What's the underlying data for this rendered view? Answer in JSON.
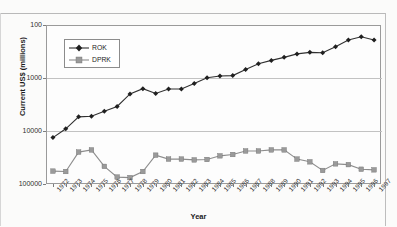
{
  "page": {
    "header_ghost_text": "",
    "background": "#fbfbfa"
  },
  "axis": {
    "y_title": "Current US$ (millions)",
    "x_title": "Year",
    "y_ticks": [
      "100000",
      "10000",
      "1000",
      "100"
    ]
  },
  "legend": {
    "items": [
      {
        "label": "ROK",
        "color": "#202020",
        "marker": "diamond"
      },
      {
        "label": "DPRK",
        "color": "#9a9a9a",
        "marker": "square"
      }
    ]
  },
  "chart_data": {
    "type": "line",
    "title": "",
    "xlabel": "Year",
    "ylabel": "Current US$ (millions)",
    "yscale": "log",
    "ylim": [
      100,
      100000
    ],
    "ytick_values": [
      100,
      1000,
      10000,
      100000
    ],
    "grid": "horizontal",
    "legend_position": "upper-left-inside",
    "categories": [
      "1972",
      "1973",
      "1974",
      "1975",
      "1976",
      "1977",
      "1978",
      "1979",
      "1980",
      "1981",
      "1982",
      "1983",
      "1984",
      "1985",
      "1986",
      "1987",
      "1988",
      "1989",
      "1990",
      "1991",
      "1992",
      "1993",
      "1994",
      "1995",
      "1996",
      "1997"
    ],
    "series": [
      {
        "name": "ROK",
        "color": "#202020",
        "marker": "diamond",
        "values": [
          750,
          1100,
          1850,
          1900,
          2350,
          2900,
          5000,
          6300,
          5100,
          6200,
          6200,
          7900,
          10100,
          10900,
          11100,
          14500,
          18500,
          21500,
          24500,
          28500,
          30500,
          30000,
          39000,
          52000,
          60000,
          52000
        ]
      },
      {
        "name": "DPRK",
        "color": "#9a9a9a",
        "marker": "square",
        "values": [
          175,
          172,
          400,
          440,
          215,
          135,
          132,
          172,
          350,
          295,
          295,
          285,
          290,
          340,
          360,
          420,
          420,
          440,
          440,
          295,
          262,
          180,
          240,
          232,
          190,
          185
        ]
      }
    ]
  }
}
